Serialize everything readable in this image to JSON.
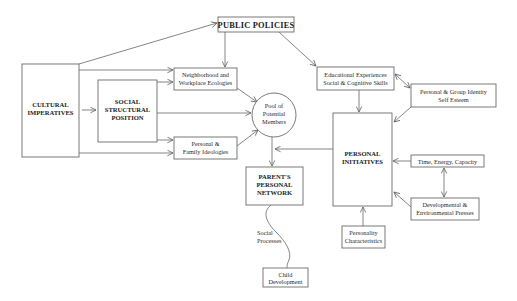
{
  "diagram": {
    "type": "conceptual-model",
    "nodes": {
      "public_policies": {
        "lines": [
          "PUBLIC POLICIES"
        ]
      },
      "cultural_imperatives": {
        "lines": [
          "CULTURAL",
          "IMPERATIVES"
        ]
      },
      "social_structural_position": {
        "lines": [
          "SOCIAL",
          "STRUCTURAL",
          "POSITION"
        ]
      },
      "neighborhood_workplace": {
        "lines": [
          "Neighborhood and",
          "Workplace Ecologies"
        ]
      },
      "personal_family_ideologies": {
        "lines": [
          "Personal &",
          "Family Ideologies"
        ]
      },
      "pool_potential_members": {
        "lines": [
          "Pool of",
          "Potential",
          "Members"
        ]
      },
      "educational_experiences": {
        "lines": [
          "Educational Experiences",
          "Social & Cognitive Skills"
        ]
      },
      "personal_group_identity": {
        "lines": [
          "Personal & Group Identity",
          "Self Esteem"
        ]
      },
      "personal_initiatives": {
        "lines": [
          "PERSONAL",
          "INITIATIVES"
        ]
      },
      "time_energy_capacity": {
        "lines": [
          "Time, Energy, Capacity"
        ]
      },
      "developmental_presses": {
        "lines": [
          "Developmental &",
          "Environmental Presses"
        ]
      },
      "parents_personal_network": {
        "lines": [
          "PARENT'S",
          "PERSONAL",
          "NETWORK"
        ]
      },
      "personality_characteristics": {
        "lines": [
          "Personality",
          "Characteristics"
        ]
      },
      "child_development": {
        "lines": [
          "Child",
          "Development"
        ]
      }
    },
    "edge_labels": {
      "social_processes": {
        "lines": [
          "Social",
          "Processes"
        ]
      }
    },
    "edges": [
      {
        "from": "cultural_imperatives",
        "to": "public_policies"
      },
      {
        "from": "public_policies",
        "to": "neighborhood_workplace"
      },
      {
        "from": "public_policies",
        "to": "educational_experiences"
      },
      {
        "from": "cultural_imperatives",
        "to": "neighborhood_workplace"
      },
      {
        "from": "social_structural_position",
        "to": "neighborhood_workplace"
      },
      {
        "from": "cultural_imperatives",
        "to": "social_structural_position"
      },
      {
        "from": "social_structural_position",
        "to": "pool_potential_members"
      },
      {
        "from": "social_structural_position",
        "to": "personal_family_ideologies"
      },
      {
        "from": "cultural_imperatives",
        "to": "personal_family_ideologies"
      },
      {
        "from": "neighborhood_workplace",
        "to": "pool_potential_members"
      },
      {
        "from": "personal_family_ideologies",
        "to": "pool_potential_members"
      },
      {
        "from": "pool_potential_members",
        "to": "parents_personal_network"
      },
      {
        "from": "personal_initiatives",
        "to": "parents_personal_network"
      },
      {
        "from": "educational_experiences",
        "to": "personal_initiatives"
      },
      {
        "from": "educational_experiences",
        "to": "personal_group_identity",
        "bidirectional": true
      },
      {
        "from": "personal_group_identity",
        "to": "personal_initiatives"
      },
      {
        "from": "time_energy_capacity",
        "to": "personal_initiatives"
      },
      {
        "from": "time_energy_capacity",
        "to": "developmental_presses",
        "bidirectional": true
      },
      {
        "from": "developmental_presses",
        "to": "personal_initiatives"
      },
      {
        "from": "personality_characteristics",
        "to": "personal_initiatives"
      },
      {
        "from": "parents_personal_network",
        "to": "child_development",
        "label": "Social Processes",
        "style": "wavy"
      }
    ],
    "colors": {
      "line": "#666666",
      "text": "#222222",
      "background": "#ffffff"
    }
  }
}
